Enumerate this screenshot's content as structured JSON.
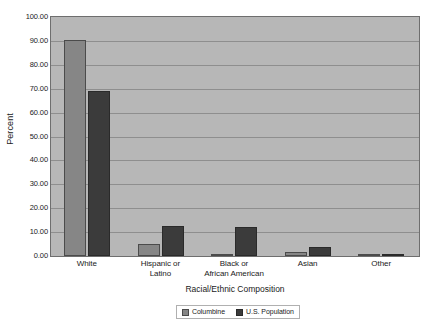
{
  "chart_data": {
    "type": "bar",
    "title": "",
    "xlabel": "Racial/Ethnic Composition",
    "ylabel": "Percent",
    "ylim": [
      0,
      100
    ],
    "ytick_step": 10,
    "ytick_labels": [
      "0.00",
      "10.00",
      "20.00",
      "30.00",
      "40.00",
      "50.00",
      "60.00",
      "70.00",
      "80.00",
      "90.00",
      "100.00"
    ],
    "ytick_values": [
      0,
      10,
      20,
      30,
      40,
      50,
      60,
      70,
      80,
      90,
      100
    ],
    "grid": true,
    "legend_position": "bottom",
    "categories": [
      "White",
      "Hispanic or\nLatino",
      "Black or\nAfrican American",
      "Asian",
      "Other"
    ],
    "category_lines": [
      [
        "White"
      ],
      [
        "Hispanic or",
        "Latino"
      ],
      [
        "Black or",
        "African American"
      ],
      [
        "Asian"
      ],
      [
        "Other"
      ]
    ],
    "series": [
      {
        "name": "Columbine",
        "color": "#868686",
        "values": [
          90.5,
          5.0,
          0.5,
          1.6,
          0.4
        ]
      },
      {
        "name": "U.S. Population",
        "color": "#3b3b3b",
        "values": [
          69.1,
          12.5,
          12.1,
          3.6,
          0.5
        ]
      }
    ],
    "plot_background": "#b7b7b7",
    "gridline_color": "#8e8e8e",
    "axis_color": "#6e6e6e"
  }
}
